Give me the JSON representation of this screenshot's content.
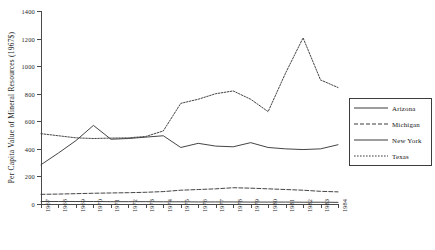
{
  "chart_data": {
    "type": "line",
    "title": "",
    "xlabel": "",
    "ylabel": "Per Capita Value of Mineral Resources (1967$)",
    "ylim": [
      0,
      1400
    ],
    "ytick_values": [
      0,
      200,
      400,
      600,
      800,
      1000,
      1200,
      1400
    ],
    "ytick_labels": [
      "0",
      "200",
      "400",
      "600",
      "800",
      "1000",
      "1200",
      "1400"
    ],
    "grid": false,
    "legend_position": "right",
    "categories": [
      "1967",
      "1968",
      "1969",
      "1970",
      "1971",
      "1972",
      "1973",
      "1974",
      "1975",
      "1976",
      "1977",
      "1978",
      "1979",
      "1980",
      "1981",
      "1982",
      "1983",
      "1984"
    ],
    "series": [
      {
        "name": "Arizona",
        "style": "solid",
        "color": "#3a3a3a",
        "values": [
          285,
          370,
          460,
          570,
          470,
          475,
          485,
          495,
          410,
          440,
          420,
          415,
          445,
          410,
          400,
          395,
          400,
          430
        ]
      },
      {
        "name": "Michigan",
        "style": "dashed",
        "color": "#3a3a3a",
        "values": [
          70,
          72,
          75,
          78,
          80,
          82,
          85,
          90,
          100,
          105,
          110,
          118,
          115,
          110,
          105,
          100,
          92,
          88
        ]
      },
      {
        "name": "New York",
        "style": "solid",
        "color": "#3a3a3a",
        "values": [
          18,
          18,
          18,
          18,
          17,
          17,
          17,
          16,
          16,
          15,
          15,
          15,
          14,
          14,
          14,
          13,
          13,
          12
        ]
      },
      {
        "name": "Texas",
        "style": "dotted",
        "color": "#3a3a3a",
        "values": [
          510,
          495,
          480,
          475,
          478,
          480,
          490,
          530,
          730,
          760,
          800,
          820,
          760,
          670,
          950,
          1205,
          900,
          845
        ]
      }
    ]
  },
  "legend": {
    "entries": [
      {
        "label": "Arizona"
      },
      {
        "label": "Michigan"
      },
      {
        "label": "New York"
      },
      {
        "label": "Texas"
      }
    ]
  }
}
